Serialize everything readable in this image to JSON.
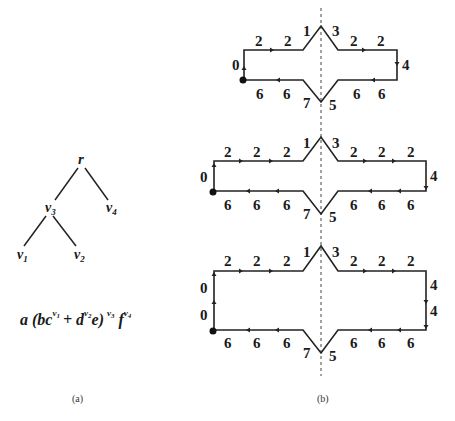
{
  "panel_a": {
    "caption": "(a)",
    "tree": {
      "root": "r",
      "nodes": [
        {
          "id": "r",
          "label": "r",
          "sub": ""
        },
        {
          "id": "v3",
          "label": "v",
          "sub": "3"
        },
        {
          "id": "v4",
          "label": "v",
          "sub": "4"
        },
        {
          "id": "v1",
          "label": "v",
          "sub": "1"
        },
        {
          "id": "v2",
          "label": "v",
          "sub": "2"
        }
      ],
      "edges": [
        [
          "r",
          "v3"
        ],
        [
          "r",
          "v4"
        ],
        [
          "v3",
          "v1"
        ],
        [
          "v3",
          "v2"
        ]
      ]
    },
    "formula": {
      "a": "a",
      "open": "(bc",
      "e1": "v",
      "e1s": "1",
      "plus": "+ d",
      "e2": "v",
      "e2s": "2",
      "close": "e)",
      "e3": "v",
      "e3s": "3",
      "f": "f",
      "e4": "v",
      "e4s": "4"
    }
  },
  "panel_b": {
    "caption": "(b)",
    "diagrams": [
      {
        "start_label": "0",
        "left_labels": [
          "0"
        ],
        "top_left_labels": [
          "2",
          "2"
        ],
        "peak_left": "1",
        "peak_right": "3",
        "top_right_labels": [
          "2",
          "2"
        ],
        "right_labels": [
          "4"
        ],
        "bottom_right_labels": [
          "6",
          "6"
        ],
        "valley_right": "5",
        "valley_left": "7",
        "bottom_left_labels": [
          "6",
          "6"
        ]
      },
      {
        "left_labels": [
          "0"
        ],
        "top_left_labels": [
          "2",
          "2",
          "2"
        ],
        "peak_left": "1",
        "peak_right": "3",
        "top_right_labels": [
          "2",
          "2",
          "2"
        ],
        "right_labels": [
          "4"
        ],
        "bottom_right_labels": [
          "6",
          "6",
          "6"
        ],
        "valley_right": "5",
        "valley_left": "7",
        "bottom_left_labels": [
          "6",
          "6",
          "6"
        ]
      },
      {
        "left_labels": [
          "0",
          "0"
        ],
        "top_left_labels": [
          "2",
          "2",
          "2"
        ],
        "peak_left": "1",
        "peak_right": "3",
        "top_right_labels": [
          "2",
          "2",
          "2"
        ],
        "right_labels": [
          "4",
          "4"
        ],
        "bottom_right_labels": [
          "6",
          "6",
          "6"
        ],
        "valley_right": "5",
        "valley_left": "7",
        "bottom_left_labels": [
          "6",
          "6",
          "6"
        ]
      }
    ]
  }
}
